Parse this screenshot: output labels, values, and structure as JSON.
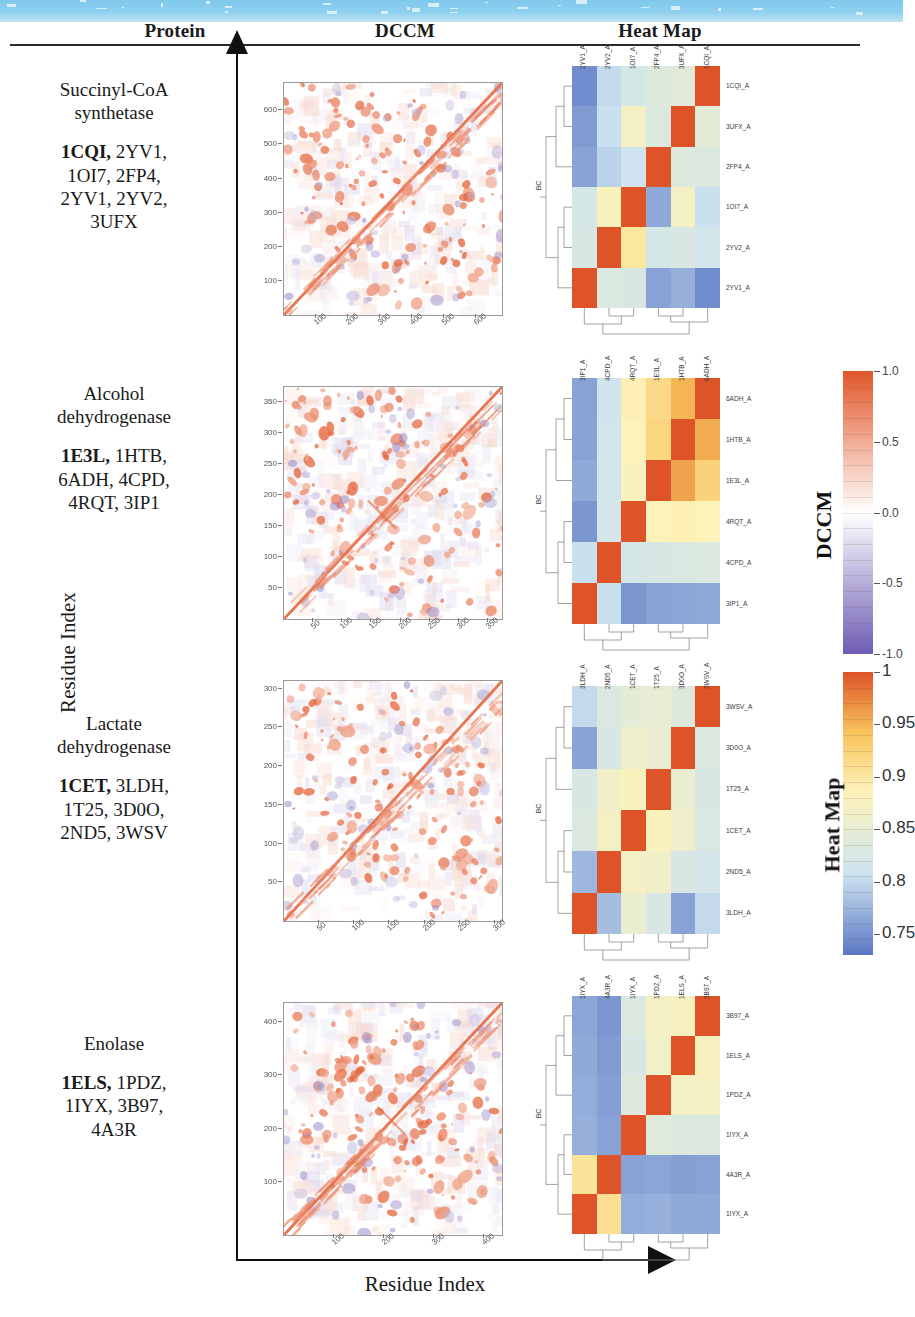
{
  "banner": {
    "color": "#8fd0ef"
  },
  "headers": [
    {
      "label": "Protein",
      "x": 60,
      "w": 230
    },
    {
      "label": "DCCM",
      "x": 290,
      "w": 230
    },
    {
      "label": "Heat Map",
      "x": 545,
      "w": 230
    }
  ],
  "axis": {
    "y_label": "Residue Index",
    "x_label": "Residue Index"
  },
  "rows": [
    {
      "protein": "Succinyl-CoA synthetase",
      "protein_line1": "Succinyl-CoA",
      "protein_line2": "synthetase",
      "pdb_bold": "1CQI,",
      "pdb_rest": "2YV1, 1OI7, 2FP4, 2YV1, 2YV2, 3UFX",
      "pdb_lines": [
        "1CQI, 2YV1,",
        "1OI7, 2FP4,",
        "2YV1, 2YV2,",
        "3UFX"
      ],
      "dccm": {
        "n": 680,
        "xticks": [
          100,
          200,
          300,
          400,
          500,
          600
        ],
        "yticks": [
          100,
          200,
          300,
          400,
          500,
          600
        ],
        "max": 680
      },
      "heatmap": {
        "row_labels": [
          "1CQI_A",
          "3UFX_A",
          "2FP4_A",
          "1OI7_A",
          "2YV2_A",
          "2YV1_A"
        ],
        "col_labels": [
          "2YV1_A",
          "2YV2_A",
          "1OI7_A",
          "2FP4_A",
          "3UFX_A",
          "1CQI_A"
        ],
        "bc_label": "BC",
        "matrix": [
          [
            0.745,
            0.8,
            0.82,
            0.835,
            0.84,
            1.0
          ],
          [
            0.755,
            0.805,
            0.87,
            0.83,
            1.0,
            0.845
          ],
          [
            0.76,
            0.795,
            0.81,
            1.0,
            0.835,
            0.83
          ],
          [
            0.82,
            0.88,
            1.0,
            0.765,
            0.87,
            0.805
          ],
          [
            0.825,
            1.0,
            0.9,
            0.82,
            0.825,
            0.815
          ],
          [
            1.0,
            0.83,
            0.825,
            0.76,
            0.77,
            0.745
          ]
        ]
      }
    },
    {
      "protein": "Alcohol dehydrogenase",
      "protein_line1": "Alcohol",
      "protein_line2": "dehydrogenase",
      "pdb_bold": "1E3L,",
      "pdb_rest": "1HTB, 6ADH, 4CPD, 4RQT, 3IP1",
      "pdb_lines": [
        "1E3L, 1HTB,",
        "6ADH, 4CPD,",
        "4RQT, 3IP1"
      ],
      "dccm": {
        "n": 374,
        "xticks": [
          50,
          100,
          150,
          200,
          250,
          300,
          350
        ],
        "yticks": [
          50,
          100,
          150,
          200,
          250,
          300,
          350
        ],
        "max": 374
      },
      "heatmap": {
        "row_labels": [
          "6ADH_A",
          "1HTB_A",
          "1E3L_A",
          "4RQT_A",
          "4CPD_A",
          "3IP1_A"
        ],
        "col_labels": [
          "3IP1_A",
          "4CPD_A",
          "4RQT_A",
          "1E3L_A",
          "1HTB_A",
          "6ADH_A"
        ],
        "bc_label": "BC",
        "matrix": [
          [
            0.76,
            0.81,
            0.89,
            0.915,
            0.95,
            1.0
          ],
          [
            0.76,
            0.815,
            0.885,
            0.92,
            1.0,
            0.955
          ],
          [
            0.765,
            0.815,
            0.88,
            1.0,
            0.96,
            0.925
          ],
          [
            0.752,
            0.818,
            1.0,
            0.885,
            0.89,
            0.885
          ],
          [
            0.805,
            1.0,
            0.82,
            0.825,
            0.828,
            0.83
          ],
          [
            1.0,
            0.805,
            0.752,
            0.76,
            0.762,
            0.765
          ]
        ]
      }
    },
    {
      "protein": "Lactate dehydrogenase",
      "protein_line1": "Lactate",
      "protein_line2": "dehydrogenase",
      "pdb_bold": "1CET,",
      "pdb_rest": "3LDH, 1T25, 3D0O, 2ND5, 3WSV",
      "pdb_lines": [
        "1CET, 3LDH,",
        "1T25, 3D0O,",
        "2ND5, 3WSV"
      ],
      "dccm": {
        "n": 310,
        "xticks": [
          50,
          100,
          150,
          200,
          250,
          300
        ],
        "yticks": [
          50,
          100,
          150,
          200,
          250,
          300
        ],
        "max": 310
      },
      "heatmap": {
        "row_labels": [
          "3WSV_A",
          "3D0O_A",
          "1T25_A",
          "1CET_A",
          "2ND5_A",
          "3LDH_A"
        ],
        "col_labels": [
          "3LDH_A",
          "2ND5_A",
          "1CET_A",
          "1T25_A",
          "3D0O_A",
          "3WSV_A"
        ],
        "bc_label": "BC",
        "matrix": [
          [
            0.8,
            0.83,
            0.845,
            0.85,
            0.835,
            1.0
          ],
          [
            0.76,
            0.825,
            0.86,
            0.855,
            1.0,
            0.83
          ],
          [
            0.825,
            0.865,
            0.88,
            1.0,
            0.855,
            0.825
          ],
          [
            0.83,
            0.87,
            1.0,
            0.88,
            0.86,
            0.828
          ],
          [
            0.775,
            1.0,
            0.87,
            0.865,
            0.825,
            0.818
          ],
          [
            1.0,
            0.78,
            0.855,
            0.825,
            0.76,
            0.8
          ]
        ]
      }
    },
    {
      "protein": "Enolase",
      "protein_line1": "Enolase",
      "protein_line2": "",
      "pdb_bold": "1ELS,",
      "pdb_rest": "1PDZ, 1IYX, 3B97, 4A3R",
      "pdb_lines": [
        "1ELS, 1PDZ,",
        "1IYX, 3B97,",
        "4A3R"
      ],
      "dccm": {
        "n": 436,
        "xticks": [
          100,
          200,
          300,
          400
        ],
        "yticks": [
          100,
          200,
          300,
          400
        ],
        "max": 436
      },
      "heatmap": {
        "row_labels": [
          "3B97_A",
          "1ELS_A",
          "1PDZ_A",
          "1IYX_A",
          "4A3R_A",
          "1IYX_A"
        ],
        "col_labels": [
          "1IYX_A",
          "4A3R_A",
          "1IYX_A",
          "1PDZ_A",
          "1ELS_A",
          "3B97_A"
        ],
        "bc_label": "BC",
        "matrix": [
          [
            0.762,
            0.752,
            0.83,
            0.87,
            0.875,
            1.0
          ],
          [
            0.765,
            0.755,
            0.825,
            0.868,
            1.0,
            0.875
          ],
          [
            0.768,
            0.758,
            0.835,
            1.0,
            0.87,
            0.872
          ],
          [
            0.77,
            0.76,
            1.0,
            0.838,
            0.832,
            0.83
          ],
          [
            0.905,
            1.0,
            0.76,
            0.762,
            0.758,
            0.76
          ],
          [
            1.0,
            0.908,
            0.768,
            0.77,
            0.766,
            0.765
          ]
        ]
      }
    }
  ],
  "colorbars": [
    {
      "title": "DCCM",
      "ticks": [
        "1.0",
        "0.5",
        "0.0",
        "-0.5",
        "-1.0"
      ],
      "values": [
        1.0,
        0.5,
        0.0,
        -0.5,
        -1.0
      ],
      "min": -1.0,
      "max": 1.0,
      "scale": "dccm"
    },
    {
      "title": "Heat Map",
      "ticks": [
        "1",
        "0.95",
        "0.9",
        "0.85",
        "0.8",
        "0.75"
      ],
      "values": [
        1,
        0.95,
        0.9,
        0.85,
        0.8,
        0.75
      ],
      "min": 0.73,
      "max": 1.0,
      "scale": "heat"
    }
  ],
  "chart_data": {
    "type": "heatmap",
    "panels": [
      {
        "protein": "Succinyl-CoA synthetase",
        "reference_pdb": "1CQI",
        "pdb_set": [
          "1CQI",
          "2YV1",
          "1OI7",
          "2FP4",
          "2YV1",
          "2YV2",
          "3UFX"
        ],
        "dccm_axis_range": [
          1,
          680
        ],
        "dccm_ticks": [
          100,
          200,
          300,
          400,
          500,
          600
        ],
        "heatmap_labels": [
          "1CQI_A",
          "3UFX_A",
          "2FP4_A",
          "1OI7_A",
          "2YV2_A",
          "2YV1_A"
        ],
        "heatmap_range": [
          0.745,
          1.0
        ]
      },
      {
        "protein": "Alcohol dehydrogenase",
        "reference_pdb": "1E3L",
        "pdb_set": [
          "1E3L",
          "1HTB",
          "6ADH",
          "4CPD",
          "4RQT",
          "3IP1"
        ],
        "dccm_axis_range": [
          1,
          374
        ],
        "dccm_ticks": [
          50,
          100,
          150,
          200,
          250,
          300,
          350
        ],
        "heatmap_labels": [
          "6ADH_A",
          "1HTB_A",
          "1E3L_A",
          "4RQT_A",
          "4CPD_A",
          "3IP1_A"
        ],
        "heatmap_range": [
          0.752,
          1.0
        ]
      },
      {
        "protein": "Lactate dehydrogenase",
        "reference_pdb": "1CET",
        "pdb_set": [
          "1CET",
          "3LDH",
          "1T25",
          "3D0O",
          "2ND5",
          "3WSV"
        ],
        "dccm_axis_range": [
          1,
          310
        ],
        "dccm_ticks": [
          50,
          100,
          150,
          200,
          250,
          300
        ],
        "heatmap_labels": [
          "3WSV_A",
          "3D0O_A",
          "1T25_A",
          "1CET_A",
          "2ND5_A",
          "3LDH_A"
        ],
        "heatmap_range": [
          0.76,
          1.0
        ]
      },
      {
        "protein": "Enolase",
        "reference_pdb": "1ELS",
        "pdb_set": [
          "1ELS",
          "1PDZ",
          "1IYX",
          "3B97",
          "4A3R"
        ],
        "dccm_axis_range": [
          1,
          436
        ],
        "dccm_ticks": [
          100,
          200,
          300,
          400
        ],
        "heatmap_labels": [
          "3B97_A",
          "1ELS_A",
          "1PDZ_A",
          "1IYX_A",
          "4A3R_A",
          "1IYX_A"
        ],
        "heatmap_range": [
          0.752,
          1.0
        ]
      }
    ],
    "dccm_colorbar": {
      "label": "DCCM",
      "min": -1.0,
      "max": 1.0,
      "ticks": [
        1.0,
        0.5,
        0.0,
        -0.5,
        -1.0
      ],
      "colors": [
        "#e2572a",
        "#ffffff",
        "#7b6fc4"
      ]
    },
    "heat_colorbar": {
      "label": "Heat Map",
      "min": 0.75,
      "max": 1.0,
      "ticks": [
        1,
        0.95,
        0.9,
        0.85,
        0.8,
        0.75
      ],
      "colors": [
        "#e2572a",
        "#fdf0a8",
        "#6c8fd0"
      ]
    },
    "xlabel": "Residue Index",
    "ylabel": "Residue Index"
  }
}
